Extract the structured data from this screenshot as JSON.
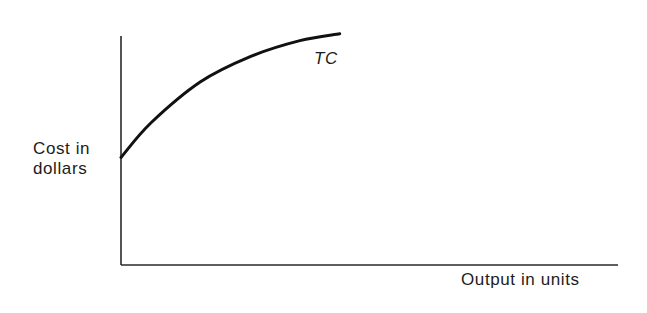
{
  "chart_data": {
    "type": "line",
    "title": "",
    "xlabel": "Output in units",
    "ylabel_lines": [
      "Cost in",
      "dollars"
    ],
    "ylabel": "Cost in dollars",
    "grid": false,
    "legend": "none (series labeled inline)",
    "axis_ticks": "none",
    "series": [
      {
        "name": "TC",
        "description": "Total cost curve: starts at a positive intercept (fixed cost) and rises at a decreasing rate (concave)",
        "points_relative": [
          {
            "x": 0.0,
            "y": 0.47
          },
          {
            "x": 0.06,
            "y": 0.62
          },
          {
            "x": 0.16,
            "y": 0.8
          },
          {
            "x": 0.26,
            "y": 0.91
          },
          {
            "x": 0.36,
            "y": 0.98
          },
          {
            "x": 0.44,
            "y": 1.01
          }
        ],
        "color": "#111111"
      }
    ],
    "xlim": [
      0,
      1
    ],
    "ylim": [
      0,
      1
    ]
  },
  "labels": {
    "series_label": "TC",
    "y_axis_line1": "Cost in",
    "y_axis_line2": "dollars",
    "x_axis": "Output in units"
  },
  "colors": {
    "background": "#ffffff",
    "ink": "#111111"
  }
}
